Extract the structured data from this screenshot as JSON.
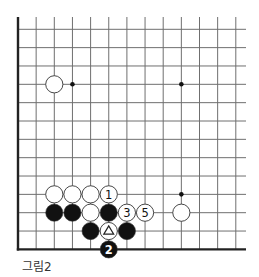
{
  "diagram": {
    "caption": "그림2",
    "colors": {
      "line": "#6f6f6f",
      "edge": "#222222",
      "black_stone": "#111111",
      "white_stone": "#ffffff",
      "stone_outline": "#333333"
    },
    "grid": {
      "x0": 18,
      "dx": 18.15,
      "cols": 13,
      "y0": 29.3,
      "dy": 18.34,
      "rows": 13,
      "top": 17,
      "right": 246,
      "left_edge": true,
      "bottom_edge": true
    },
    "star_points": [
      {
        "col": 3,
        "row": 3
      },
      {
        "col": 9,
        "row": 3
      },
      {
        "col": 9,
        "row": 9
      }
    ],
    "stones": [
      {
        "color": "white",
        "col": 2,
        "row": 3,
        "label": ""
      },
      {
        "color": "white",
        "col": 2,
        "row": 9,
        "label": ""
      },
      {
        "color": "white",
        "col": 3,
        "row": 9,
        "label": ""
      },
      {
        "color": "white",
        "col": 4,
        "row": 9,
        "label": ""
      },
      {
        "color": "white",
        "col": 5,
        "row": 9,
        "label": "1"
      },
      {
        "color": "black",
        "col": 2,
        "row": 10,
        "label": ""
      },
      {
        "color": "black",
        "col": 3,
        "row": 10,
        "label": ""
      },
      {
        "color": "white",
        "col": 4,
        "row": 10,
        "label": ""
      },
      {
        "color": "black",
        "col": 5,
        "row": 10,
        "label": ""
      },
      {
        "color": "white",
        "col": 6,
        "row": 10,
        "label": "3"
      },
      {
        "color": "white",
        "col": 7,
        "row": 10,
        "label": "5"
      },
      {
        "color": "white",
        "col": 9,
        "row": 10,
        "label": ""
      },
      {
        "color": "black",
        "col": 4,
        "row": 11,
        "label": ""
      },
      {
        "color": "white",
        "col": 5,
        "row": 11,
        "label": "triangle"
      },
      {
        "color": "black",
        "col": 6,
        "row": 11,
        "label": ""
      },
      {
        "color": "black",
        "col": 5,
        "row": 12,
        "label": "2"
      }
    ]
  }
}
